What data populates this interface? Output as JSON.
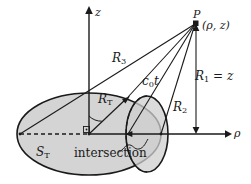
{
  "figure": {
    "name": "cylindrical-coordinate-wave-intersection-diagram",
    "background_color": "#ffffff",
    "stroke_color": "#1a1a1a",
    "fill_color": "#d4d4d4",
    "axes": {
      "vertical": {
        "label": "z",
        "origin": [
          89,
          134
        ],
        "tip": [
          89,
          8
        ]
      },
      "horizontal": {
        "label": "ρ",
        "origin": [
          89,
          134
        ],
        "tip": [
          229,
          134
        ]
      }
    },
    "point_P": {
      "label": "P",
      "coordinates_label": "(ρ, z)",
      "position": [
        196,
        23
      ]
    },
    "segments": {
      "R3": {
        "label_main": "R",
        "label_sub": "3"
      },
      "c0t": {
        "label_main": "c",
        "label_sub": "0",
        "label_tail": "t"
      },
      "R1": {
        "label_main": "R",
        "label_sub": "1",
        "label_tail": " = z"
      },
      "R2": {
        "label_main": "R",
        "label_sub": "2"
      },
      "RT": {
        "label_main": "R",
        "label_sub": "T"
      }
    },
    "regions": {
      "ST": {
        "label_main": "S",
        "label_sub": "T"
      },
      "intersection": {
        "label": "intersection"
      }
    }
  }
}
